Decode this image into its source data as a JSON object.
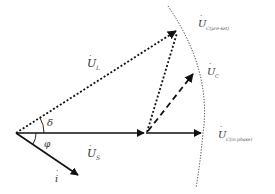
{
  "diagram": {
    "type": "phasor-diagram",
    "colors": {
      "line": "#111111",
      "arc": "#333333",
      "text": "#333333"
    },
    "labels": {
      "U_L": {
        "main": "U",
        "sub": "L"
      },
      "U_S": {
        "main": "U",
        "sub": "S"
      },
      "U_C": {
        "main": "U",
        "sub": "C"
      },
      "U_C_pre_set": {
        "main": "U",
        "sub": "C(pre-set)"
      },
      "U_C_in_phase": {
        "main": "U",
        "sub": "C(in-phase)"
      },
      "current": {
        "main": "i"
      },
      "delta": "δ",
      "phi": "φ"
    },
    "phasors": [
      {
        "name": "U_S",
        "from": [
          16,
          133
        ],
        "to": [
          146,
          133
        ],
        "style": "solid"
      },
      {
        "name": "U_C_in_phase",
        "from": [
          146,
          133
        ],
        "to": [
          203,
          133
        ],
        "style": "solid"
      },
      {
        "name": "U_L",
        "from": [
          16,
          133
        ],
        "to": [
          178,
          30
        ],
        "style": "dotted"
      },
      {
        "name": "U_C_pre_set",
        "from": [
          146,
          133
        ],
        "to": [
          178,
          30
        ],
        "style": "dotted"
      },
      {
        "name": "U_C",
        "from": [
          146,
          133
        ],
        "to": [
          195,
          72
        ],
        "style": "dashed"
      },
      {
        "name": "i",
        "from": [
          16,
          133
        ],
        "to": [
          80,
          176
        ],
        "style": "solid"
      }
    ],
    "arc": {
      "style": "dotted",
      "description": "locus of U_C magnitude"
    }
  }
}
